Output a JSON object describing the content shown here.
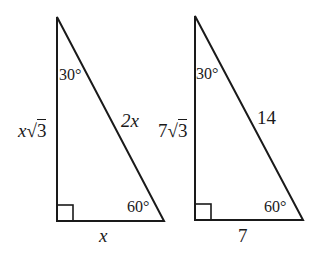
{
  "diagram": {
    "stroke_color": "#1a1a1a",
    "background": "#ffffff",
    "triangles": [
      {
        "id": "general",
        "vertices": {
          "top": [
            57,
            17
          ],
          "right_angle": [
            57,
            221
          ],
          "base_right": [
            164,
            221
          ]
        },
        "angle_top": "30°",
        "angle_bottom_right": "60°",
        "right_angle_marker": true,
        "side_vertical": {
          "coef": "x",
          "radical": "3"
        },
        "side_hypotenuse": "2x",
        "side_base": "x"
      },
      {
        "id": "example",
        "vertices": {
          "top": [
            195,
            16
          ],
          "right_angle": [
            195,
            220
          ],
          "base_right": [
            303,
            220
          ]
        },
        "angle_top": "30°",
        "angle_bottom_right": "60°",
        "right_angle_marker": true,
        "side_vertical": {
          "coef": "7",
          "radical": "3"
        },
        "side_hypotenuse": "14",
        "side_base": "7"
      }
    ],
    "radical_symbol": "√"
  }
}
